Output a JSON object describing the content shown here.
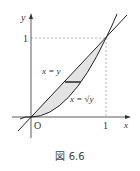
{
  "figure": {
    "caption": "図 6.6",
    "labels": {
      "y_axis": "y",
      "x_axis": "x",
      "y_tick": "1",
      "x_tick": "1",
      "origin": "O",
      "curve1": "x = y",
      "curve2": "x = √y"
    },
    "colors": {
      "fill": "#e0e0e0",
      "line": "#222222",
      "guide": "#888888"
    }
  }
}
